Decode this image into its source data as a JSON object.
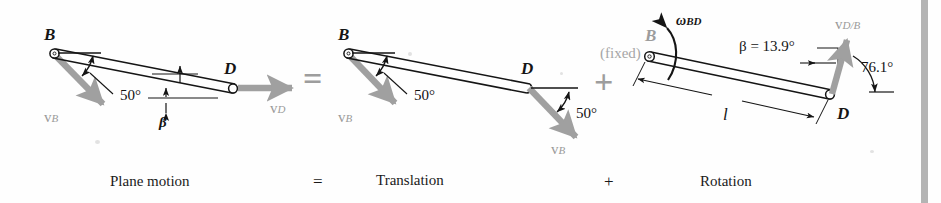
{
  "figure": {
    "background_color": "#fefefe",
    "ink_color": "#151515",
    "accent_gray": "#9a9a9a",
    "vector_gray": "#a0a0a0",
    "operator_gray": "#9d9d9d",
    "edge_bar_color": "#b4b4b4"
  },
  "panels": [
    {
      "id": "plane-motion",
      "caption": "Plane motion",
      "point_b": "B",
      "point_d": "D",
      "vector_b": "v",
      "vector_b_sub": "B",
      "vector_d": "v",
      "vector_d_sub": "D",
      "angle_50": "50°",
      "angle_beta": "β"
    },
    {
      "id": "translation",
      "caption": "Translation",
      "point_b": "B",
      "point_d": "D",
      "vector_b_at_b": "v",
      "vector_b_at_b_sub": "B",
      "vector_b_at_d": "v",
      "vector_b_at_d_sub": "B",
      "angle_50_at_b": "50°",
      "angle_50_at_d": "50°"
    },
    {
      "id": "rotation",
      "caption": "Rotation",
      "point_b": "B",
      "point_d": "D",
      "fixed_note": "(fixed)",
      "omega": "ω",
      "omega_sub": "BD",
      "beta_value": "β = 13.9°",
      "angle_761": "76.1°",
      "length_label": "l",
      "vector_db": "v",
      "vector_db_sub": "D/B"
    }
  ],
  "operators": {
    "equals_symbol": "=",
    "plus_symbol": "+",
    "equals_caption": "=",
    "plus_caption": "+"
  }
}
